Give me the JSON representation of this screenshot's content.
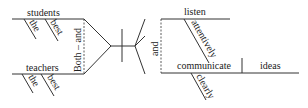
{
  "diagram": {
    "type": "sentence-diagram",
    "subjects": {
      "conjunction": "Both – and",
      "top": {
        "word": "students",
        "modifiers": [
          "the",
          "best"
        ]
      },
      "bottom": {
        "word": "teachers",
        "modifiers": [
          "the",
          "best"
        ]
      }
    },
    "predicates": {
      "conjunction": "and",
      "top": {
        "word": "listen",
        "modifiers": [
          "attentively"
        ]
      },
      "bottom": {
        "word": "communicate",
        "modifiers": [
          "clearly"
        ],
        "object": "ideas"
      }
    }
  }
}
